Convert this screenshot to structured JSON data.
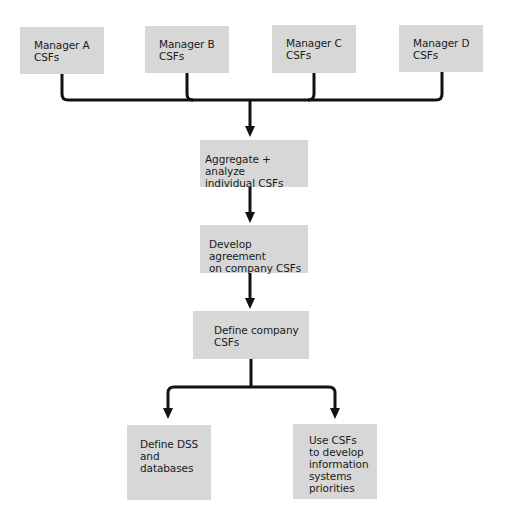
{
  "diagram": {
    "type": "flowchart",
    "colors": {
      "box_fill": "#d7d7d7",
      "line": "#111111",
      "text": "#1a1a1a",
      "background": "#ffffff"
    },
    "managers": [
      {
        "id": "manager-a",
        "lines": [
          "Manager A",
          "CSFs"
        ]
      },
      {
        "id": "manager-b",
        "lines": [
          "Manager B",
          "CSFs"
        ]
      },
      {
        "id": "manager-c",
        "lines": [
          "Manager C",
          "CSFs"
        ]
      },
      {
        "id": "manager-d",
        "lines": [
          "Manager D",
          "CSFs"
        ]
      }
    ],
    "steps": [
      {
        "id": "aggregate",
        "lines": [
          "Aggregate + analyze",
          "individual CSFs"
        ]
      },
      {
        "id": "agreement",
        "lines": [
          "Develop agreement",
          "on company CSFs"
        ]
      },
      {
        "id": "define-company",
        "lines": [
          "Define company",
          "CSFs"
        ]
      }
    ],
    "outcomes": [
      {
        "id": "define-dss",
        "lines": [
          "Define DSS",
          "and",
          "databases"
        ]
      },
      {
        "id": "use-csfs",
        "lines": [
          "Use CSFs",
          "to develop",
          "information",
          "systems",
          "priorities"
        ]
      }
    ],
    "edges": [
      [
        "manager-a",
        "aggregate"
      ],
      [
        "manager-b",
        "aggregate"
      ],
      [
        "manager-c",
        "aggregate"
      ],
      [
        "manager-d",
        "aggregate"
      ],
      [
        "aggregate",
        "agreement"
      ],
      [
        "agreement",
        "define-company"
      ],
      [
        "define-company",
        "define-dss"
      ],
      [
        "define-company",
        "use-csfs"
      ]
    ]
  }
}
